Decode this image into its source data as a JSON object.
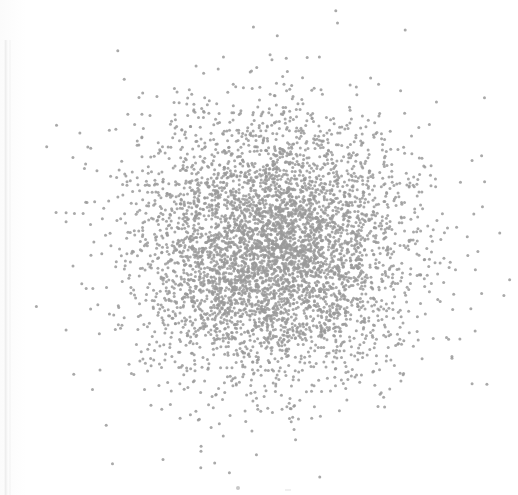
{
  "figure": {
    "width": 518,
    "height": 495,
    "background_color": "#fefefe",
    "paper_edge_color": "#f0f0f0",
    "caption": ""
  },
  "artifacts": {
    "scan_edge_label": "scan-page-edge-line",
    "bottom_speck_label": "scan-speck"
  },
  "chart_data": {
    "type": "scatter",
    "title": "",
    "subtitle": "",
    "xlabel": "",
    "ylabel": "",
    "legend": [],
    "legend_position": "none",
    "grid": false,
    "axes_visible": false,
    "tick_labels_x": [],
    "tick_labels_y": [],
    "marker": {
      "shape": "circle",
      "color": "#9a9a9a",
      "size_px": 3,
      "opacity": 0.85
    },
    "n_points": 5000,
    "distribution": "bivariate-gaussian-isotropic",
    "center_px": [
      272,
      250
    ],
    "sigma_px": [
      68,
      66
    ],
    "xlim": [
      0,
      518
    ],
    "ylim": [
      0,
      495
    ],
    "radius_visible_px": 230,
    "series": [
      {
        "name": "points",
        "color": "#9a9a9a",
        "center": [
          272,
          250
        ],
        "sigma": [
          68,
          66
        ],
        "count": 5000
      }
    ]
  }
}
